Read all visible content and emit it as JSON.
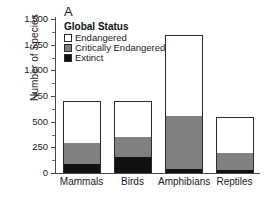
{
  "panel_label": "A",
  "legend": {
    "title": "Global Status",
    "entries": [
      {
        "label": "Endangered",
        "color": "#ffffff"
      },
      {
        "label": "Critically Endangered",
        "color": "#808080"
      },
      {
        "label": "Extinct",
        "color": "#111111"
      }
    ]
  },
  "axis": {
    "ylabel": "Number of Species",
    "yticks": [
      "0",
      "250",
      "500",
      "750",
      "1,000",
      "1,250",
      "1,500"
    ]
  },
  "chart_data": {
    "type": "bar",
    "title": "A",
    "xlabel": "",
    "ylabel": "Number of Species",
    "ylim": [
      0,
      1500
    ],
    "ytick_values": [
      0,
      250,
      500,
      750,
      1000,
      1250,
      1500
    ],
    "grid": false,
    "stacked": true,
    "legend_position": "upper-left-inside",
    "categories": [
      "Mammals",
      "Birds",
      "Amphibians",
      "Reptiles"
    ],
    "series": [
      {
        "name": "Extinct",
        "color": "#111111",
        "values": [
          88,
          155,
          38,
          28
        ]
      },
      {
        "name": "Critically Endangered",
        "color": "#808080",
        "values": [
          204,
          195,
          517,
          167
        ]
      },
      {
        "name": "Endangered",
        "color": "#ffffff",
        "values": [
          408,
          350,
          790,
          350
        ]
      }
    ],
    "cumulative_tops": {
      "Extinct": [
        88,
        155,
        38,
        28
      ],
      "Critically Endangered": [
        292,
        350,
        555,
        195
      ],
      "Endangered": [
        700,
        700,
        1345,
        545
      ]
    },
    "totals": [
      700,
      700,
      1345,
      545
    ]
  }
}
